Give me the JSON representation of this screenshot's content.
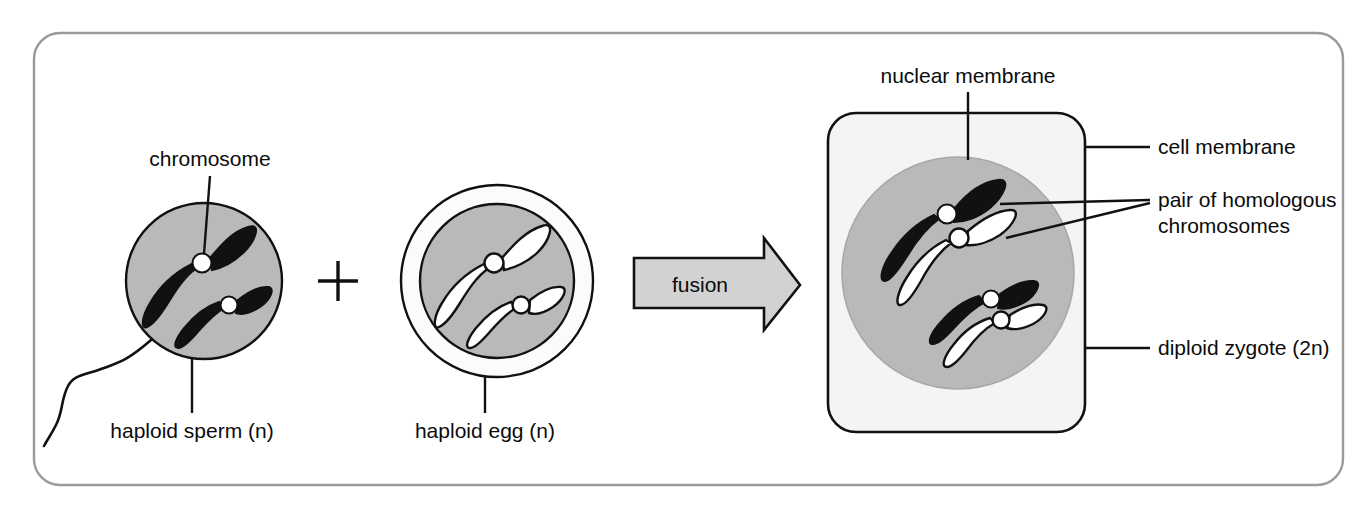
{
  "figure": {
    "frame_color": "#9a9a9a",
    "background_color": "#ffffff"
  },
  "colors": {
    "cytoplasm_gray": "#b9b9b9",
    "nucleus_gray": "#b9b9b9",
    "zygote_cytoplasm": "#f4f4f4",
    "arrow_fill": "#d2d2d2",
    "chromosome_dark": "#111111",
    "chromosome_light": "#ffffff",
    "centromere": "#ffffff",
    "outline": "#000000",
    "text": "#0b0b0b"
  },
  "labels": {
    "chromosome": "chromosome",
    "haploid_sperm": "haploid sperm (n)",
    "haploid_egg": "haploid egg (n)",
    "fusion": "fusion",
    "nuclear_membrane": "nuclear membrane",
    "cell_membrane": "cell membrane",
    "pair_homologous_line1": "pair of homologous",
    "pair_homologous_line2": "chromosomes",
    "diploid_zygote": "diploid zygote (2n)",
    "plus_sign": "+"
  },
  "cells": {
    "sperm": {
      "name": "haploid sperm (n)",
      "ploidy": "n",
      "chromosome_count": 2,
      "chromosome_color": "dark",
      "has_tail": true,
      "has_outer_ring": false
    },
    "egg": {
      "name": "haploid egg (n)",
      "ploidy": "n",
      "chromosome_count": 2,
      "chromosome_color": "light",
      "has_tail": false,
      "has_outer_ring": true
    },
    "zygote": {
      "name": "diploid zygote (2n)",
      "ploidy": "2n",
      "chromosome_count": 4,
      "homologous_pairs": 2,
      "chromosome_colors": [
        "dark",
        "light",
        "dark",
        "light"
      ],
      "shape": "rounded-square"
    }
  }
}
